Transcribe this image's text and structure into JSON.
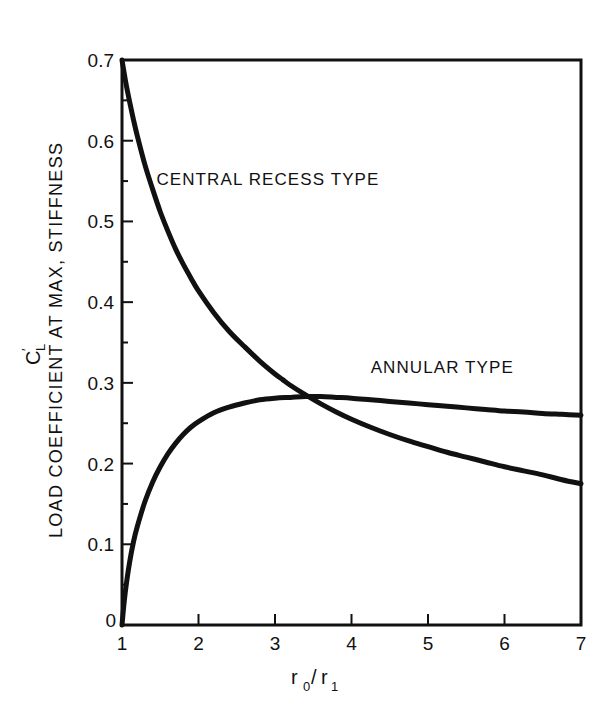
{
  "chart_data": {
    "type": "line",
    "title": "",
    "xlabel": "r0/r1",
    "xlabel_parts": {
      "base1": "r",
      "sub1": "0",
      "slash": "/",
      "base2": "r",
      "sub2": "1"
    },
    "ylabel": "LOAD COEFFICIENT AT MAX, STIFFNESS",
    "ylabel_symbol": {
      "base": "C",
      "sub": "L",
      "prime": "′"
    },
    "xlim": [
      1,
      7
    ],
    "ylim": [
      0,
      0.7
    ],
    "xticks": [
      1,
      2,
      3,
      4,
      5,
      6,
      7
    ],
    "xtick_labels": [
      "1",
      "2",
      "3",
      "4",
      "5",
      "6",
      "7"
    ],
    "yticks": [
      0,
      0.1,
      0.2,
      0.3,
      0.4,
      0.5,
      0.6,
      0.7
    ],
    "ytick_labels": [
      "0",
      "0.1",
      "0.2",
      "0.3",
      "0.4",
      "0.5",
      "0.6",
      "0.7"
    ],
    "y_minor_ticks": [
      0.05,
      0.15,
      0.25,
      0.35,
      0.45,
      0.55,
      0.65
    ],
    "grid": false,
    "legend_position": "inline-annotations",
    "line_color": "#111111",
    "background_color": "#ffffff",
    "series": [
      {
        "name": "CENTRAL RECESS TYPE",
        "label_x": 1.45,
        "label_y": 0.545,
        "x": [
          1.0,
          1.05,
          1.1,
          1.15,
          1.2,
          1.3,
          1.4,
          1.5,
          1.6,
          1.7,
          1.8,
          1.9,
          2.0,
          2.2,
          2.4,
          2.6,
          2.8,
          3.0,
          3.1,
          3.2,
          3.4,
          3.6,
          3.8,
          4.0,
          4.25,
          4.5,
          4.75,
          5.0,
          5.25,
          5.5,
          5.75,
          6.0,
          6.25,
          6.5,
          6.75,
          7.0
        ],
        "y": [
          0.7,
          0.672,
          0.648,
          0.626,
          0.606,
          0.57,
          0.54,
          0.512,
          0.488,
          0.466,
          0.447,
          0.43,
          0.414,
          0.387,
          0.364,
          0.345,
          0.327,
          0.311,
          0.304,
          0.297,
          0.285,
          0.274,
          0.264,
          0.255,
          0.245,
          0.236,
          0.228,
          0.221,
          0.214,
          0.208,
          0.202,
          0.196,
          0.191,
          0.186,
          0.18,
          0.175
        ]
      },
      {
        "name": "ANNULAR TYPE",
        "label_x": 4.25,
        "label_y": 0.312,
        "x": [
          1.0,
          1.03,
          1.06,
          1.1,
          1.15,
          1.2,
          1.3,
          1.4,
          1.5,
          1.6,
          1.7,
          1.8,
          1.9,
          2.0,
          2.2,
          2.4,
          2.6,
          2.8,
          3.0,
          3.2,
          3.4,
          3.6,
          3.8,
          4.0,
          4.25,
          4.5,
          4.75,
          5.0,
          5.25,
          5.5,
          5.75,
          6.0,
          6.25,
          6.5,
          6.75,
          7.0
        ],
        "y": [
          0.0,
          0.03,
          0.053,
          0.078,
          0.103,
          0.122,
          0.153,
          0.177,
          0.196,
          0.212,
          0.225,
          0.236,
          0.245,
          0.252,
          0.263,
          0.27,
          0.275,
          0.279,
          0.281,
          0.282,
          0.283,
          0.283,
          0.282,
          0.281,
          0.279,
          0.277,
          0.275,
          0.273,
          0.271,
          0.269,
          0.267,
          0.265,
          0.264,
          0.262,
          0.261,
          0.26
        ]
      }
    ],
    "annotations": [
      {
        "text": "CENTRAL RECESS TYPE"
      },
      {
        "text": "ANNULAR TYPE"
      }
    ]
  }
}
